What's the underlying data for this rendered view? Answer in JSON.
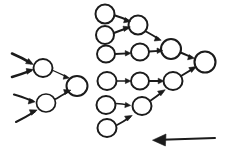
{
  "canvas": {
    "width": 227,
    "height": 160,
    "background_color": "#ffffff",
    "ink_color": "#1b1b1b",
    "style": "hand-drawn pen sketch",
    "title": "Hand-drawn directed graph of circles and arrows"
  },
  "diagram_data": {
    "type": "node-link-diagram",
    "description": "Two hand-sketched clusters of small circles connected by arrows flowing left to right, plus a long left-pointing arrow at lower right.",
    "clusters": [
      {
        "id": "left-cluster",
        "name": "left-cluster",
        "node_count": 3,
        "incoming_arrow_count": 4,
        "nodes": [
          {
            "id": "L1",
            "cx": 43,
            "cy": 68,
            "rx": 9.5,
            "ry": 9.0,
            "role": "hidden"
          },
          {
            "id": "L2",
            "cx": 46,
            "cy": 103,
            "rx": 9.5,
            "ry": 9.0,
            "role": "hidden"
          },
          {
            "id": "L3",
            "cx": 77,
            "cy": 86,
            "rx": 10.5,
            "ry": 10.0,
            "role": "output"
          }
        ],
        "external_inputs": [
          {
            "id": "I1",
            "from": [
              12,
              54
            ],
            "to": [
              32,
              64
            ],
            "weight": "thick"
          },
          {
            "id": "I2",
            "from": [
              12,
              76
            ],
            "to": [
              32,
              70
            ],
            "weight": "thick"
          },
          {
            "id": "I3",
            "from": [
              14,
              95
            ],
            "to": [
              34,
              101
            ],
            "weight": "thick"
          },
          {
            "id": "I4",
            "from": [
              16,
              122
            ],
            "to": [
              36,
              110
            ],
            "weight": "thick"
          }
        ],
        "edges": [
          {
            "from": "L1",
            "to": "L3",
            "weight": "thin"
          },
          {
            "from": "L2",
            "to": "L3",
            "weight": "medium"
          }
        ]
      },
      {
        "id": "right-cluster",
        "name": "right-cluster",
        "node_count": 11,
        "nodes": [
          {
            "id": "A1",
            "cx": 105,
            "cy": 14,
            "rx": 9.5,
            "ry": 9.5,
            "role": "input"
          },
          {
            "id": "A2",
            "cx": 105,
            "cy": 35,
            "rx": 9.0,
            "ry": 9.0,
            "role": "input"
          },
          {
            "id": "A3",
            "cx": 106,
            "cy": 54,
            "rx": 9.0,
            "ry": 8.5,
            "role": "input"
          },
          {
            "id": "B1",
            "cx": 138,
            "cy": 25,
            "rx": 9.5,
            "ry": 9.5,
            "role": "hidden"
          },
          {
            "id": "B2",
            "cx": 140,
            "cy": 52,
            "rx": 9.0,
            "ry": 8.5,
            "role": "hidden"
          },
          {
            "id": "C1",
            "cx": 171,
            "cy": 49,
            "rx": 10.0,
            "ry": 10.0,
            "role": "hidden"
          },
          {
            "id": "D1",
            "cx": 205,
            "cy": 62,
            "rx": 10.5,
            "ry": 10.5,
            "role": "output"
          },
          {
            "id": "E1",
            "cx": 107,
            "cy": 81,
            "rx": 9.5,
            "ry": 9.0,
            "role": "input"
          },
          {
            "id": "E2",
            "cx": 106,
            "cy": 105,
            "rx": 9.5,
            "ry": 9.0,
            "role": "input"
          },
          {
            "id": "E3",
            "cx": 107,
            "cy": 128,
            "rx": 9.5,
            "ry": 9.0,
            "role": "input"
          },
          {
            "id": "F1",
            "cx": 140,
            "cy": 81,
            "rx": 9.0,
            "ry": 8.5,
            "role": "hidden"
          },
          {
            "id": "F2",
            "cx": 142,
            "cy": 106,
            "rx": 9.5,
            "ry": 9.0,
            "role": "hidden"
          },
          {
            "id": "G1",
            "cx": 173,
            "cy": 81,
            "rx": 9.5,
            "ry": 9.0,
            "role": "hidden"
          }
        ],
        "edges": [
          {
            "from": "A1",
            "to": "B1",
            "weight": "thick"
          },
          {
            "from": "A2",
            "to": "B1",
            "weight": "thick"
          },
          {
            "from": "A3",
            "to": "B2",
            "weight": "medium"
          },
          {
            "from": "B1",
            "to": "C1",
            "weight": "medium"
          },
          {
            "from": "B2",
            "to": "C1",
            "weight": "medium"
          },
          {
            "from": "C1",
            "to": "D1",
            "weight": "medium"
          },
          {
            "from": "E1",
            "to": "F1",
            "weight": "thin"
          },
          {
            "from": "E2",
            "to": "F2",
            "weight": "thin"
          },
          {
            "from": "E3",
            "to": "F2",
            "weight": "medium"
          },
          {
            "from": "F1",
            "to": "G1",
            "weight": "medium"
          },
          {
            "from": "F2",
            "to": "G1",
            "weight": "medium"
          },
          {
            "from": "G1",
            "to": "D1",
            "weight": "medium"
          }
        ]
      }
    ],
    "standalone_arrows": [
      {
        "id": "back-arrow",
        "name": "backward-flow-arrow",
        "direction": "left",
        "from": [
          215,
          138
        ],
        "to": [
          152,
          140
        ],
        "weight": "medium"
      }
    ]
  }
}
